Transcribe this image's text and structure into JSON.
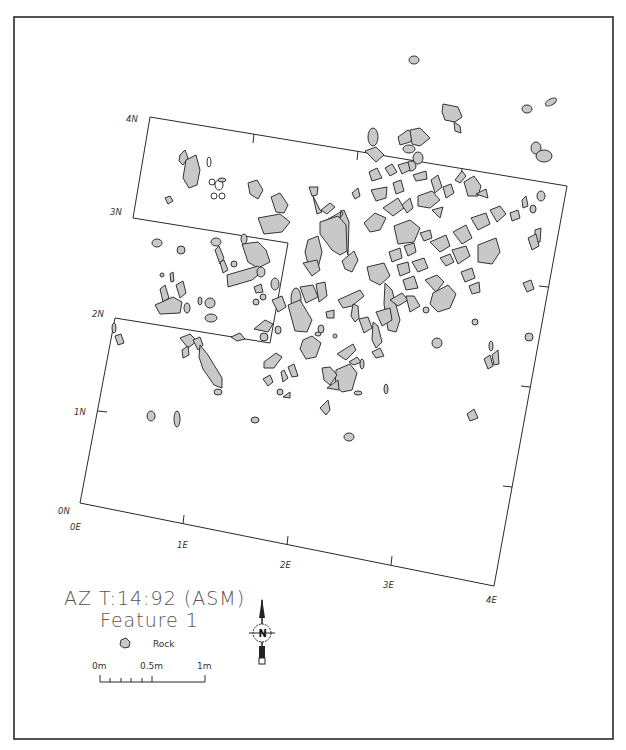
{
  "map": {
    "title_line1": "AZ T:14:92 (ASM)",
    "title_line2": "Feature 1",
    "colors": {
      "rock_fill": "#c8c8c8",
      "rock_stroke": "#333333",
      "grid_stroke": "#2a2a2a",
      "background": "#ffffff",
      "title_text": "#555555"
    },
    "grid_labels": {
      "north": [
        "0N",
        "1N",
        "2N",
        "3N",
        "4N"
      ],
      "east": [
        "0E",
        "1E",
        "2E",
        "3E",
        "4E"
      ]
    },
    "axis_labels": {
      "n4": "4N",
      "n3": "3N",
      "n2": "2N",
      "n1": "1N",
      "n0": "0N",
      "e0": "0E",
      "e1": "1E",
      "e2": "2E",
      "e3": "3E",
      "e4": "4E"
    },
    "legend": {
      "rock_label": "Rock"
    },
    "scale_bar": {
      "label_0": "0m",
      "label_mid": "0.5m",
      "label_end": "1m"
    },
    "north_arrow": {
      "label": "N"
    }
  }
}
